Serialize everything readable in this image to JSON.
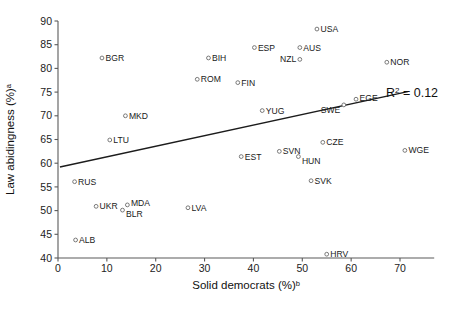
{
  "chart_data": {
    "type": "scatter",
    "title": "",
    "xlabel": "Solid democrats (%)",
    "xlabel_superscript": "b",
    "ylabel": "Law abidingness (%)",
    "ylabel_superscript": "a",
    "xlim": [
      0,
      77
    ],
    "ylim": [
      40,
      90
    ],
    "xticks": [
      0,
      10,
      20,
      30,
      40,
      50,
      60,
      70
    ],
    "yticks": [
      40,
      45,
      50,
      55,
      60,
      65,
      70,
      75,
      80,
      85,
      90
    ],
    "grid": false,
    "legend": "none",
    "annotation": "R² = 0.12",
    "annotation_base": "R",
    "annotation_sup": "2",
    "annotation_rest": " = 0.12",
    "r_squared": 0.12,
    "trendline": {
      "type": "linear",
      "x_start": 0.4,
      "y_start": 59.2,
      "x_end": 71.6,
      "y_end": 75.1
    },
    "marker_style": "open-circle",
    "points": [
      {
        "label": "USA",
        "x": 53.0,
        "y": 88.3
      },
      {
        "label": "ESP",
        "x": 40.2,
        "y": 84.4
      },
      {
        "label": "AUS",
        "x": 49.5,
        "y": 84.4
      },
      {
        "label": "BGR",
        "x": 9.0,
        "y": 82.2
      },
      {
        "label": "BIH",
        "x": 30.8,
        "y": 82.2
      },
      {
        "label": "NZL",
        "x": 49.5,
        "y": 81.9
      },
      {
        "label": "NOR",
        "x": 67.3,
        "y": 81.3
      },
      {
        "label": "ROM",
        "x": 28.5,
        "y": 77.7
      },
      {
        "label": "FIN",
        "x": 36.8,
        "y": 77.0
      },
      {
        "label": "EGE",
        "x": 61.0,
        "y": 73.5
      },
      {
        "label": "SWE",
        "x": 58.5,
        "y": 72.3
      },
      {
        "label": "YUG",
        "x": 41.8,
        "y": 71.1
      },
      {
        "label": "MKD",
        "x": 13.8,
        "y": 70.0
      },
      {
        "label": "LTU",
        "x": 10.6,
        "y": 64.9
      },
      {
        "label": "CZE",
        "x": 54.2,
        "y": 64.4
      },
      {
        "label": "WGE",
        "x": 71.0,
        "y": 62.7
      },
      {
        "label": "SVN",
        "x": 45.3,
        "y": 62.5
      },
      {
        "label": "HUN",
        "x": 49.2,
        "y": 61.4
      },
      {
        "label": "EST",
        "x": 37.5,
        "y": 61.4
      },
      {
        "label": "SVK",
        "x": 51.8,
        "y": 56.3
      },
      {
        "label": "RUS",
        "x": 3.4,
        "y": 56.1
      },
      {
        "label": "MDA",
        "x": 14.2,
        "y": 51.2
      },
      {
        "label": "UKR",
        "x": 7.8,
        "y": 50.9
      },
      {
        "label": "LVA",
        "x": 26.6,
        "y": 50.6
      },
      {
        "label": "BLR",
        "x": 13.2,
        "y": 50.1
      },
      {
        "label": "ALB",
        "x": 3.6,
        "y": 43.8
      },
      {
        "label": "HRV",
        "x": 55.0,
        "y": 40.8
      }
    ]
  }
}
